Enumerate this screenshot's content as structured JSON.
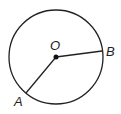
{
  "diagram": {
    "type": "circle-with-radii",
    "center": {
      "label": "O",
      "x": 56,
      "y": 57
    },
    "radius": 47,
    "points": [
      {
        "label": "A",
        "x": 26,
        "y": 93
      },
      {
        "label": "B",
        "x": 102,
        "y": 51
      }
    ],
    "segments": [
      {
        "from": "O",
        "to": "A"
      },
      {
        "from": "O",
        "to": "B"
      }
    ],
    "colors": {
      "stroke": "#222222",
      "background": "#ffffff"
    }
  }
}
